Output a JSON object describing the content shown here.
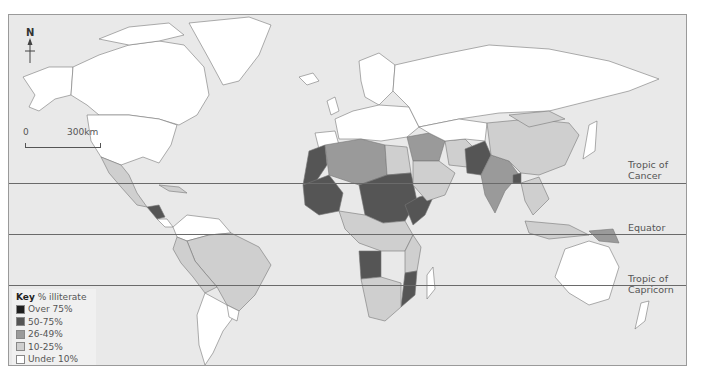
{
  "map": {
    "north_label": "N",
    "scale": {
      "start": "0",
      "end": "300km"
    },
    "lines": [
      {
        "name": "tropic-of-cancer",
        "label_line1": "Tropic of",
        "label_line2": "Cancer",
        "y": 168
      },
      {
        "name": "equator",
        "label_line1": "",
        "label_line2": "Equator",
        "y": 219
      },
      {
        "name": "tropic-of-capricorn",
        "label_line1": "Tropic of",
        "label_line2": "Capricorn",
        "y": 270
      }
    ]
  },
  "legend": {
    "title_bold": "Key",
    "title_rest": " % illiterate",
    "items": [
      {
        "label": "Over 75%",
        "color": "#1e1e1e"
      },
      {
        "label": "50-75%",
        "color": "#555555"
      },
      {
        "label": "26-49%",
        "color": "#9a9a9a"
      },
      {
        "label": "10-25%",
        "color": "#cfcfcf"
      },
      {
        "label": "Under 10%",
        "color": "#ffffff"
      }
    ]
  },
  "colors": {
    "ocean": "#e9e9e9",
    "land": "#ffffff",
    "border": "#555555"
  }
}
